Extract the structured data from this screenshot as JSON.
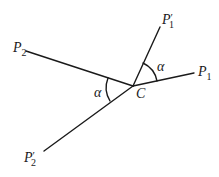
{
  "diagram": {
    "type": "geometry",
    "colors": {
      "stroke": "#1a1a1a",
      "background": "#ffffff"
    },
    "center": {
      "label": "C",
      "x": 133,
      "y": 86
    },
    "points": [
      {
        "id": "P1",
        "letter": "P",
        "subscript": "1",
        "prime": "",
        "x": 194,
        "y": 73
      },
      {
        "id": "P1p",
        "letter": "P",
        "subscript": "1",
        "prime": "′",
        "x": 160,
        "y": 27
      },
      {
        "id": "P2",
        "letter": "P",
        "subscript": "2",
        "prime": "",
        "x": 26,
        "y": 51
      },
      {
        "id": "P2p",
        "letter": "P",
        "subscript": "2",
        "prime": "′",
        "x": 44,
        "y": 151
      }
    ],
    "segments": [
      {
        "from": "C",
        "to": "P1"
      },
      {
        "from": "C",
        "to": "P1p"
      },
      {
        "from": "C",
        "to": "P2"
      },
      {
        "from": "C",
        "to": "P2p"
      }
    ],
    "angles": [
      {
        "label": "α",
        "between": [
          "P1p",
          "P1"
        ],
        "vertex": "C"
      },
      {
        "label": "α",
        "between": [
          "P2",
          "P2p"
        ],
        "vertex": "C"
      }
    ]
  }
}
